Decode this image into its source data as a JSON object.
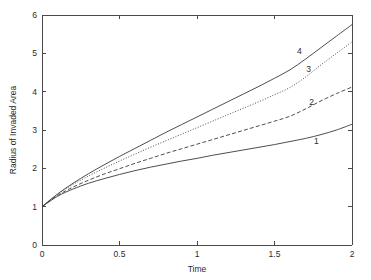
{
  "chart_data": {
    "type": "line",
    "title": "",
    "xlabel": "Time",
    "ylabel": "Radius of Invaded Area",
    "xlim": [
      0,
      2
    ],
    "ylim": [
      0,
      6
    ],
    "xticks": [
      "0",
      "0.5",
      "1",
      "1.5",
      "2"
    ],
    "xtick_values": [
      0,
      0.5,
      1,
      1.5,
      2
    ],
    "yticks": [
      "0",
      "1",
      "2",
      "3",
      "4",
      "5",
      "6"
    ],
    "ytick_values": [
      0,
      1,
      2,
      3,
      4,
      5,
      6
    ],
    "grid": false,
    "legend": "inline-curve-labels",
    "x": [
      0,
      0.1,
      0.2,
      0.3,
      0.4,
      0.5,
      0.6,
      0.7,
      0.8,
      0.9,
      1.0,
      1.1,
      1.2,
      1.3,
      1.4,
      1.5,
      1.6,
      1.7,
      1.8,
      1.9,
      2.0
    ],
    "series": [
      {
        "name": "1",
        "label": "1",
        "style": "solid",
        "color": "#3a3a3a",
        "label_x": 1.77,
        "label_y": 2.72,
        "values": [
          1.0,
          1.27,
          1.46,
          1.61,
          1.73,
          1.84,
          1.94,
          2.03,
          2.11,
          2.19,
          2.26,
          2.34,
          2.41,
          2.48,
          2.55,
          2.62,
          2.7,
          2.78,
          2.88,
          3.0,
          3.15
        ]
      },
      {
        "name": "2",
        "label": "2",
        "style": "dashed",
        "color": "#3a3a3a",
        "label_x": 1.74,
        "label_y": 3.73,
        "values": [
          1.0,
          1.29,
          1.51,
          1.69,
          1.85,
          1.99,
          2.13,
          2.26,
          2.39,
          2.51,
          2.63,
          2.75,
          2.87,
          2.99,
          3.11,
          3.23,
          3.36,
          3.55,
          3.76,
          3.95,
          4.12
        ]
      },
      {
        "name": "3",
        "label": "3",
        "style": "dotted",
        "color": "#3a3a3a",
        "label_x": 1.72,
        "label_y": 4.58,
        "values": [
          1.0,
          1.32,
          1.58,
          1.8,
          2.0,
          2.19,
          2.37,
          2.55,
          2.72,
          2.89,
          3.06,
          3.23,
          3.4,
          3.57,
          3.74,
          3.92,
          4.11,
          4.38,
          4.7,
          5.0,
          5.3
        ]
      },
      {
        "name": "4",
        "label": "4",
        "style": "solid",
        "color": "#3a3a3a",
        "label_x": 1.66,
        "label_y": 5.07,
        "values": [
          1.0,
          1.33,
          1.61,
          1.86,
          2.09,
          2.31,
          2.52,
          2.73,
          2.94,
          3.14,
          3.34,
          3.54,
          3.74,
          3.94,
          4.14,
          4.35,
          4.57,
          4.85,
          5.15,
          5.45,
          5.75
        ]
      }
    ]
  },
  "axes": {
    "tick_direction": "in",
    "box": true,
    "background": "#ffffff",
    "line_color": "#4a4a4a"
  }
}
